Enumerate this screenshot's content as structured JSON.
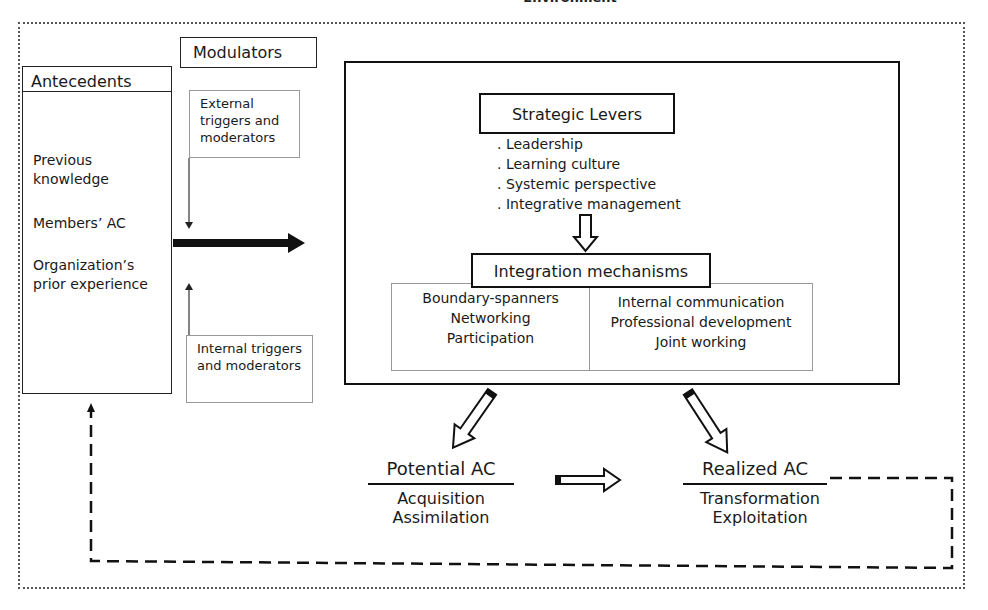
{
  "environment": {
    "title": "Environment"
  },
  "modulators": {
    "label": "Modulators",
    "external": "External triggers and moderators",
    "internal": "Internal triggers and moderators"
  },
  "antecedents": {
    "title": "Antecedents",
    "items": [
      "Previous knowledge",
      "Members’ AC",
      "Organization’s prior experience"
    ]
  },
  "strategic_levers": {
    "title": "Strategic Levers",
    "items": [
      ". Leadership",
      ". Learning culture",
      ". Systemic perspective",
      ". Integrative management"
    ]
  },
  "integration_mechanisms": {
    "title": "Integration mechanisms",
    "left": [
      "Boundary-spanners",
      "Networking",
      "Participation"
    ],
    "right": [
      "Internal communication",
      "Professional development",
      "Joint working"
    ]
  },
  "potential_ac": {
    "title": "Potential AC",
    "items": [
      "Acquisition",
      "Assimilation"
    ]
  },
  "realized_ac": {
    "title": "Realized AC",
    "items": [
      "Transformation",
      "Exploitation"
    ]
  },
  "colors": {
    "line": "#111111",
    "thin_border": "#999999",
    "dotted_border": "#555555"
  }
}
